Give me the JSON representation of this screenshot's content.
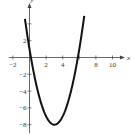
{
  "chart_data": {
    "type": "line",
    "title": "",
    "xlabel": "x",
    "ylabel": "y",
    "xlim": [
      -2.5,
      11.5
    ],
    "ylim": [
      -9,
      6.5
    ],
    "x_ticks": [
      -2,
      2,
      4,
      8,
      10
    ],
    "x_tick_labels": [
      "−2",
      "2",
      "4",
      "8",
      "10"
    ],
    "y_ticks": [
      2,
      -2,
      -4,
      -6,
      -8
    ],
    "y_tick_labels": [
      "2",
      "−2",
      "−4",
      "−6",
      "−8"
    ],
    "x_minor_ticks": [
      -2,
      2,
      4,
      6,
      8,
      10
    ],
    "y_minor_ticks": [
      4,
      2,
      -2,
      -4,
      -6,
      -8
    ],
    "grid": false,
    "series": [
      {
        "name": "y = x² − 6x + 1",
        "function": "x^2 - 6x + 1",
        "x_range": [
          -0.55,
          6.6
        ],
        "vertex": [
          3,
          -8
        ],
        "x_intercepts": [
          0.17,
          5.83
        ]
      }
    ]
  }
}
